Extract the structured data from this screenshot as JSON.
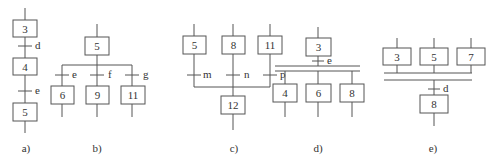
{
  "diagrams": {
    "a": {
      "caption": "a)",
      "steps": [
        "3",
        "4",
        "5"
      ],
      "transitions": [
        "d",
        "e"
      ]
    },
    "b": {
      "caption": "b)",
      "source_step": "5",
      "branches": [
        {
          "transition": "e",
          "step": "6"
        },
        {
          "transition": "f",
          "step": "9"
        },
        {
          "transition": "g",
          "step": "11"
        }
      ]
    },
    "c": {
      "caption": "c)",
      "branches": [
        {
          "step": "5",
          "transition": "m"
        },
        {
          "step": "8",
          "transition": "n"
        },
        {
          "step": "11",
          "transition": "p"
        }
      ],
      "target_step": "12"
    },
    "d": {
      "caption": "d)",
      "source_step": "3",
      "transition": "e",
      "parallel_steps": [
        "4",
        "6",
        "8"
      ]
    },
    "e": {
      "caption": "e)",
      "parallel_steps": [
        "3",
        "5",
        "7"
      ],
      "transition": "d",
      "target_step": "8"
    }
  },
  "colors": {
    "line": "#555555",
    "text": "#333333",
    "background": "#ffffff"
  }
}
